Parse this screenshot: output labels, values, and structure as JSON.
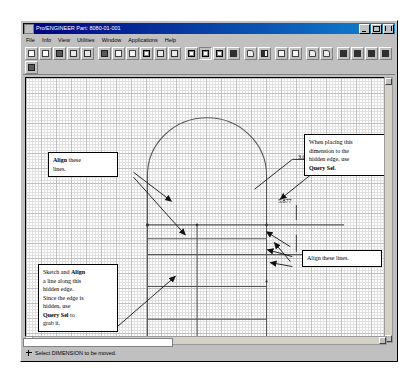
{
  "window": {
    "title": "Pro/ENGINEER Part: 8080-01-001",
    "icon": "app-icon",
    "controls": {
      "minimize": "_",
      "maximize": "□",
      "close": "×"
    }
  },
  "menu": {
    "items": [
      {
        "label": "File"
      },
      {
        "label": "Info"
      },
      {
        "label": "View"
      },
      {
        "label": "Utilities"
      },
      {
        "label": "Window"
      },
      {
        "label": "Applications"
      },
      {
        "label": "Help"
      }
    ]
  },
  "toolbar_1": {
    "tools": [
      {
        "name": "new-file-icon"
      },
      {
        "name": "open-file-icon"
      },
      {
        "name": "save-file-icon"
      },
      {
        "name": "print-preview-icon"
      },
      {
        "name": "print-icon"
      },
      {
        "name": "repaint-icon"
      },
      {
        "name": "zoom-in-icon"
      },
      {
        "name": "zoom-out-icon"
      },
      {
        "name": "refit-icon"
      },
      {
        "name": "spin-icon"
      },
      {
        "name": "pan-icon"
      },
      {
        "name": "wireframe-icon"
      },
      {
        "name": "hidden-line-icon"
      },
      {
        "name": "no-hidden-icon"
      },
      {
        "name": "shaded-icon"
      },
      {
        "name": "datum-plane-icon"
      },
      {
        "name": "datum-axis-icon"
      },
      {
        "name": "datum-point-icon"
      },
      {
        "name": "datum-csys-icon"
      },
      {
        "name": "undo-icon"
      },
      {
        "name": "redo-icon"
      },
      {
        "name": "layer-icon"
      },
      {
        "name": "model-tree-icon"
      },
      {
        "name": "grid-icon"
      },
      {
        "name": "close-window-icon"
      }
    ]
  },
  "toolbar_2": {
    "tools": [
      {
        "name": "sketch-tool-icon"
      }
    ]
  },
  "canvas": {
    "dimensions": [
      {
        "name": "dimension-3000",
        "value": "3.000"
      },
      {
        "name": "dimension-5877",
        "value": "5.877"
      }
    ],
    "callouts": [
      {
        "name": "callout-align-lines",
        "lines": [
          [
            {
              "t": "Align",
              "b": true
            },
            {
              "t": " these"
            }
          ],
          [
            {
              "t": "lines."
            }
          ]
        ]
      },
      {
        "name": "callout-query-sel-dimension",
        "lines": [
          [
            {
              "t": "When placing this"
            }
          ],
          [
            {
              "t": "dimension to the"
            }
          ],
          [
            {
              "t": "hidden edge, use"
            }
          ],
          [
            {
              "t": "Query Sel",
              "b": true
            },
            {
              "t": "."
            }
          ]
        ]
      },
      {
        "name": "callout-align-these-lines",
        "lines": [
          [
            {
              "t": "Align these lines."
            }
          ]
        ]
      },
      {
        "name": "callout-sketch-align-hidden-edge",
        "lines": [
          [
            {
              "t": "Sketch and "
            },
            {
              "t": "Align",
              "b": true
            }
          ],
          [
            {
              "t": "a line along this"
            }
          ],
          [
            {
              "t": "hidden edge."
            }
          ],
          [
            {
              "t": "Since the edge is"
            }
          ],
          [
            {
              "t": "hidden, use"
            }
          ],
          [
            {
              "t": "Query Sel",
              "b": true
            },
            {
              "t": " to"
            }
          ],
          [
            {
              "t": "grab it."
            }
          ]
        ]
      }
    ]
  },
  "status": {
    "text": "Select DIMENSION to be moved.",
    "icon": "crosshair-icon"
  },
  "colors": {
    "title_bar_start": "#000080",
    "title_bar_end": "#1084d0",
    "window_face": "#c0c0c0",
    "canvas_bg": "#ffffff",
    "geometry": "#555555",
    "grid": "#aeaeae"
  }
}
